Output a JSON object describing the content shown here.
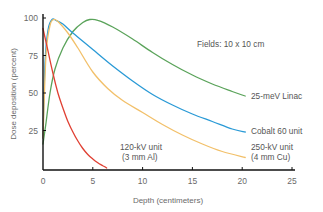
{
  "chart_data": {
    "type": "line",
    "title": "",
    "xlabel": "Depth (centimeters)",
    "ylabel": "Dose deposition (percent)",
    "xlim": [
      0,
      25
    ],
    "ylim": [
      0,
      100
    ],
    "x_ticks": [
      0,
      5,
      10,
      15,
      20,
      25
    ],
    "y_ticks": [
      25,
      50,
      75,
      100
    ],
    "grid": false,
    "legend": "inline labels at line ends",
    "annotations": [
      {
        "text": "Fields: 10 x 10 cm",
        "x": 16,
        "y": 84
      }
    ],
    "series": [
      {
        "name": "25-meV Linac",
        "color": "#5aa35a",
        "label_lines": [
          "25-meV Linac"
        ],
        "x": [
          0,
          0.3,
          0.7,
          1.2,
          2,
          3,
          4,
          4.7,
          5.5,
          7,
          9,
          11,
          13,
          15,
          17,
          19,
          20.3
        ],
        "y": [
          16,
          30,
          50,
          66,
          80,
          91,
          97,
          99,
          98.5,
          94,
          86,
          77,
          69,
          62,
          56,
          51,
          48
        ]
      },
      {
        "name": "Cobalt 60 unit",
        "color": "#2a9ad6",
        "label_lines": [
          "Cobalt 60 unit"
        ],
        "x": [
          0,
          0.2,
          0.5,
          0.9,
          1.3,
          2,
          3,
          5,
          7,
          9,
          11,
          13,
          15,
          17,
          19,
          20.3
        ],
        "y": [
          20,
          70,
          92,
          99,
          98.5,
          96,
          90,
          79,
          68,
          58,
          49,
          42,
          36,
          31,
          26,
          24
        ]
      },
      {
        "name": "250-kV unit (4 mm Cu)",
        "color": "#f2c06a",
        "label_lines": [
          "250-kV unit",
          "(4 mm Cu)"
        ],
        "x": [
          0,
          0.3,
          0.7,
          1.1,
          1.6,
          2.5,
          3.5,
          5,
          6.5,
          8,
          10,
          12,
          14,
          16,
          18,
          20.3
        ],
        "y": [
          20,
          75,
          95,
          99,
          97,
          90,
          80,
          64,
          53,
          45,
          37,
          29,
          22,
          16,
          11,
          7
        ]
      },
      {
        "name": "120-kV unit (3 mm Al)",
        "color": "#e04033",
        "label_lines": [
          "120-kV unit",
          "(3 mm Al)"
        ],
        "x": [
          0,
          0.5,
          1,
          1.5,
          2,
          2.5,
          3,
          3.5,
          4,
          4.5,
          5,
          5.5,
          6,
          6.4
        ],
        "y": [
          93,
          78,
          63,
          50,
          40,
          31,
          24,
          18,
          13,
          9,
          6,
          3.5,
          1.5,
          0
        ]
      }
    ]
  }
}
